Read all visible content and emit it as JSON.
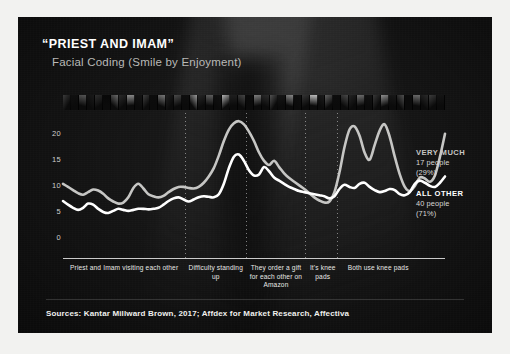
{
  "slide": {
    "title": "“PRIEST AND IMAM”",
    "subtitle": "Facial Coding (Smile by Enjoyment)",
    "sources": "Sources: Kantar Millward Brown, 2017; Affdex for Market Research, Affectiva",
    "background_color": "#161616",
    "frame_color": "#f2f2f0"
  },
  "legend": {
    "items": [
      {
        "name": "VERY MUCH",
        "people": "17 people",
        "percent": "(29%)",
        "color": "#c6c6c4"
      },
      {
        "name": "ALL OTHER",
        "people": "40 people",
        "percent": "(71%)",
        "color": "#ffffff"
      }
    ]
  },
  "filmstrip": {
    "label": "video-thumbnail-strip",
    "cells": [
      "#3a3a3a",
      "#101010",
      "#565656",
      "#1a1a1a",
      "#2e2e2e",
      "#080808",
      "#6a6a6a",
      "#2a2a2a",
      "#8c8c8c",
      "#141414",
      "#3e3e3e",
      "#0c0c0c",
      "#7a7a7a",
      "#202020",
      "#4a4a4a",
      "#0e0e0e",
      "#9a9a9a",
      "#262626",
      "#5e5e5e",
      "#121212",
      "#b4b4b4",
      "#1e1e1e",
      "#464646",
      "#0a0a0a",
      "#7e7e7e",
      "#2c2c2c",
      "#525252",
      "#161616",
      "#888888",
      "#101010",
      "#343434",
      "#c0c0c0",
      "#1c1c1c",
      "#606060",
      "#0d0d0d",
      "#484848",
      "#242424",
      "#707070",
      "#121212",
      "#383838",
      "#909090",
      "#181818",
      "#505050",
      "#0b0b0b",
      "#6c6c6c",
      "#2a2a2a",
      "#3c3c3c",
      "#141414"
    ]
  },
  "chart_data": {
    "type": "line",
    "title": "“PRIEST AND IMAM” Facial Coding (Smile by Enjoyment)",
    "xlabel": "",
    "ylabel": "",
    "ylim": [
      0,
      23
    ],
    "yticks": [
      0,
      5,
      10,
      15,
      20
    ],
    "ytick_labels": [
      "0",
      "5",
      "10",
      "15",
      "20"
    ],
    "grid": "vertical-dotted",
    "legend_position": "right",
    "x": [
      0,
      1,
      2,
      3,
      4,
      5,
      6,
      7,
      8,
      9,
      10,
      11,
      12,
      13,
      14,
      15,
      16,
      17,
      18,
      19,
      20,
      21,
      22,
      23,
      24,
      25,
      26,
      27,
      28,
      29,
      30,
      31,
      32,
      33,
      34,
      35,
      36,
      37,
      38,
      39,
      40,
      41,
      42,
      43,
      44,
      45,
      46,
      47,
      48,
      49,
      50,
      51,
      52,
      53,
      54,
      55,
      56,
      57,
      58,
      59,
      60,
      61,
      62,
      63,
      64,
      65,
      66,
      67,
      68,
      69,
      70,
      71,
      72,
      73,
      74,
      75,
      76
    ],
    "series": [
      {
        "name": "VERY MUCH",
        "color": "#c6c6c4",
        "values": [
          10.2,
          9.6,
          9.0,
          8.4,
          8.1,
          8.6,
          9.1,
          8.9,
          8.3,
          7.4,
          6.8,
          6.4,
          6.6,
          7.6,
          9.4,
          10.2,
          9.3,
          8.2,
          7.8,
          7.6,
          7.9,
          8.6,
          9.2,
          9.6,
          9.6,
          9.4,
          9.3,
          9.6,
          10.4,
          11.6,
          13.2,
          15.6,
          18.4,
          20.6,
          21.8,
          22.2,
          21.6,
          20.2,
          18.4,
          16.2,
          14.6,
          13.8,
          14.6,
          13.4,
          12.2,
          11.3,
          10.6,
          9.9,
          9.2,
          8.4,
          7.6,
          7.0,
          6.6,
          6.8,
          8.6,
          12.4,
          17.2,
          20.6,
          21.2,
          19.4,
          16.2,
          14.8,
          17.6,
          20.4,
          21.6,
          19.2,
          15.4,
          12.0,
          9.6,
          8.8,
          9.8,
          11.4,
          11.2,
          10.6,
          11.8,
          15.4,
          19.8
        ]
      },
      {
        "name": "ALL OTHER",
        "color": "#ffffff",
        "values": [
          6.9,
          6.2,
          5.6,
          5.2,
          5.6,
          6.4,
          6.2,
          5.4,
          4.8,
          4.6,
          5.0,
          5.4,
          5.2,
          5.0,
          5.2,
          5.4,
          5.4,
          5.3,
          5.4,
          5.6,
          6.2,
          6.9,
          7.4,
          7.6,
          7.2,
          6.8,
          7.2,
          7.6,
          7.8,
          7.7,
          7.6,
          8.2,
          10.2,
          13.2,
          15.4,
          15.8,
          14.6,
          12.8,
          11.8,
          12.0,
          13.4,
          12.6,
          11.4,
          10.8,
          10.2,
          9.6,
          9.2,
          8.8,
          8.6,
          8.4,
          8.2,
          8.0,
          7.8,
          7.4,
          7.8,
          9.2,
          10.0,
          9.6,
          9.4,
          10.2,
          10.4,
          9.6,
          9.0,
          8.6,
          8.8,
          9.2,
          9.0,
          8.2,
          8.0,
          8.6,
          10.2,
          10.8,
          10.4,
          9.8,
          9.6,
          10.4,
          11.6
        ]
      }
    ],
    "annotations": [
      {
        "label": "Priest and Imam visiting each other",
        "x_pct": 0.0,
        "width_pct": 0.32
      },
      {
        "label": "Difficulty standing up",
        "x_pct": 0.32,
        "width_pct": 0.16
      },
      {
        "label": "They order a gift for each other on Amazon",
        "x_pct": 0.48,
        "width_pct": 0.155
      },
      {
        "label": "It's knee pads",
        "x_pct": 0.635,
        "width_pct": 0.09
      },
      {
        "label": "Both use knee pads",
        "x_pct": 0.725,
        "width_pct": 0.2
      }
    ],
    "gridlines_x_pct": [
      0.319,
      0.479,
      0.634,
      0.716
    ]
  }
}
